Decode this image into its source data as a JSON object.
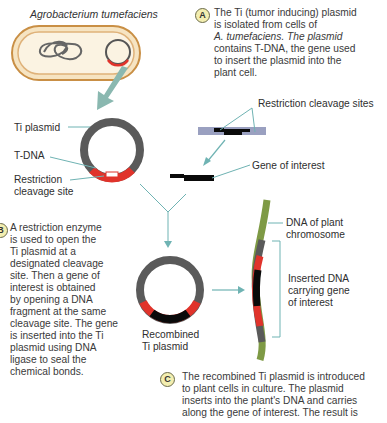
{
  "title": "Agrobacterium tumefaciens",
  "step_a": {
    "badge": "A",
    "lines": [
      "The Ti (tumor inducing) plasmid",
      "is isolated from cells of",
      "A. tumefaciens. The plasmid",
      "contains T-DNA, the gene used",
      "to insert the plasmid into the",
      "plant cell."
    ]
  },
  "step_b": {
    "badge": "B",
    "lines": [
      "A restriction enzyme",
      "is used to open the",
      "Ti plasmid at a",
      "designated cleavage",
      "site. Then a gene of",
      "interest is obtained",
      "by opening a DNA",
      "fragment at the same",
      "cleavage site. The gene",
      "is inserted into the Ti",
      "plasmid using DNA",
      "ligase to seal the",
      "chemical bonds."
    ]
  },
  "step_c": {
    "badge": "C",
    "lines": [
      "The recombined Ti plasmid is introduced",
      "to plant cells in culture. The plasmid",
      "inserts into the plant's DNA and carries",
      "along the gene of interest. The result is"
    ]
  },
  "labels": {
    "ti_plasmid": "Ti plasmid",
    "t_dna": "T-DNA",
    "restriction_site_1": "Restriction",
    "restriction_site_2": "cleavage site",
    "restriction_sites": "Restriction cleavage sites",
    "gene_of_interest": "Gene of interest",
    "plant_dna_1": "DNA of plant",
    "plant_dna_2": "chromosome",
    "inserted_1": "Inserted DNA",
    "inserted_2": "carrying gene",
    "inserted_3": "of interest",
    "recombined_1": "Recombined",
    "recombined_2": "Ti plasmid"
  },
  "colors": {
    "plasmid": "#5a5a5a",
    "tdna": "#e0332b",
    "gene": "#0a0a0a",
    "arrow": "#6fb3b3",
    "chromosome": "#7e9a45",
    "fragment": "#9aa0c0",
    "cell_fill": "#fbf0d8",
    "cell_border": "#d9a35a"
  }
}
